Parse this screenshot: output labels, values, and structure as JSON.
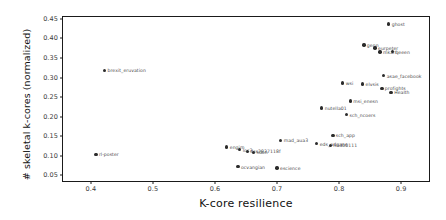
{
  "chart_data": {
    "type": "scatter",
    "title": "",
    "xlabel": "K-core resilience",
    "ylabel": "# skeletal k-cores (normalized)",
    "xlim": [
      0.355,
      0.945
    ],
    "ylim": [
      0.035,
      0.455
    ],
    "xticks": [
      "0.4",
      "0.5",
      "0.6",
      "0.7",
      "0.8",
      "0.9"
    ],
    "xtick_values": [
      0.4,
      0.5,
      0.6,
      0.7,
      0.8,
      0.9
    ],
    "yticks": [
      "0.05",
      "0.10",
      "0.15",
      "0.20",
      "0.25",
      "0.30",
      "0.35",
      "0.40",
      "0.45"
    ],
    "ytick_values": [
      0.05,
      0.1,
      0.15,
      0.2,
      0.25,
      0.3,
      0.35,
      0.4,
      0.45
    ],
    "grid": false,
    "legend": false,
    "marker_color": "#2b2b2b",
    "label_color": "#4a4a4a",
    "points": [
      {
        "label": "rl-poster",
        "x": 0.408,
        "y": 0.103
      },
      {
        "label": "brexit_eruvation",
        "x": 0.422,
        "y": 0.318
      },
      {
        "label": "ocvangian",
        "x": 0.637,
        "y": 0.072
      },
      {
        "label": "escience",
        "x": 0.7,
        "y": 0.068
      },
      {
        "label": "engim",
        "x": 0.619,
        "y": 0.122
      },
      {
        "label": "loc3",
        "x": 0.64,
        "y": 0.115
      },
      {
        "label": "dss2837118f",
        "x": 0.652,
        "y": 0.111
      },
      {
        "label": "sdon",
        "x": 0.662,
        "y": 0.108
      },
      {
        "label": "mad_aua3",
        "x": 0.706,
        "y": 0.139
      },
      {
        "label": "nutella01",
        "x": 0.772,
        "y": 0.222
      },
      {
        "label": "eds_adgans",
        "x": 0.764,
        "y": 0.131
      },
      {
        "label": "hndb0111",
        "x": 0.786,
        "y": 0.126
      },
      {
        "label": "sch_app",
        "x": 0.79,
        "y": 0.152
      },
      {
        "label": "sch_ncoers",
        "x": 0.812,
        "y": 0.205
      },
      {
        "label": "msi_enesn",
        "x": 0.818,
        "y": 0.24
      },
      {
        "label": "wsi",
        "x": 0.806,
        "y": 0.286
      },
      {
        "label": "elvsis",
        "x": 0.838,
        "y": 0.283
      },
      {
        "label": "profights",
        "x": 0.869,
        "y": 0.272
      },
      {
        "label": "Health",
        "x": 0.884,
        "y": 0.262
      },
      {
        "label": "asae_facebook",
        "x": 0.872,
        "y": 0.305
      },
      {
        "label": "genn",
        "x": 0.84,
        "y": 0.383
      },
      {
        "label": "eurpeter",
        "x": 0.858,
        "y": 0.376
      },
      {
        "label": "mkarf",
        "x": 0.866,
        "y": 0.365
      },
      {
        "label": "qeeen",
        "x": 0.886,
        "y": 0.366
      },
      {
        "label": "ghost",
        "x": 0.88,
        "y": 0.437
      }
    ]
  }
}
